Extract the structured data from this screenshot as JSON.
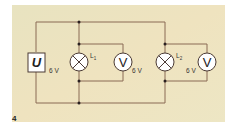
{
  "figure": {
    "number": "4",
    "background_color": "#ece5bf",
    "wire_color": "#8a6a55",
    "symbol_stroke": "#4a3a35"
  },
  "source": {
    "label": "U",
    "voltage": "6 V"
  },
  "lamps": [
    {
      "label": "L",
      "subscript": "1"
    },
    {
      "label": "L",
      "subscript": "2"
    }
  ],
  "voltmeters": [
    {
      "label": "V",
      "reading": "6 V"
    },
    {
      "label": "V",
      "reading": "6 V"
    }
  ]
}
